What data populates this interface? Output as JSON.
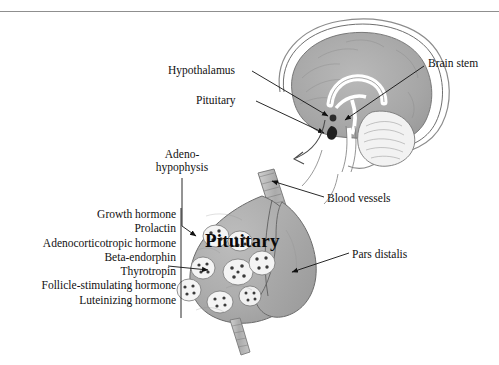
{
  "figure": {
    "title": "Pituitary",
    "background_color": "#ffffff",
    "ink_color": "#111111",
    "rule_color": "#8f8f8f"
  },
  "brain_panel": {
    "labels": {
      "hypothalamus": "Hypothalamus",
      "pituitary": "Pituitary",
      "brain_stem": "Brain stem"
    }
  },
  "gland_panel": {
    "title": "Pituitary",
    "labels": {
      "adenohypophysis_line1": "Adeno-",
      "adenohypophysis_line2": "hypophysis",
      "blood_vessels": "Blood vessels",
      "pars_distalis": "Pars distalis"
    }
  },
  "hormones": [
    "Growth hormone",
    "Prolactin",
    "Adenocorticotropic hormone",
    "Beta-endorphin",
    "Thyrotropin",
    "Follicle-stimulating hormone",
    "Luteinizing hormone"
  ]
}
